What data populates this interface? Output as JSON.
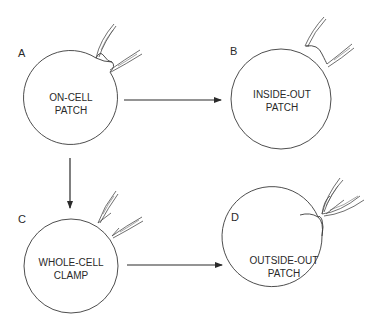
{
  "diagram": {
    "type": "patch-clamp-configurations",
    "stroke_color": "#3a3a3a",
    "background": "#ffffff",
    "panels": [
      {
        "id": "A",
        "letter": "A",
        "line1": "ON-CELL",
        "line2": "PATCH"
      },
      {
        "id": "B",
        "letter": "B",
        "line1": "INSIDE-OUT",
        "line2": "PATCH"
      },
      {
        "id": "C",
        "letter": "C",
        "line1": "WHOLE-CELL",
        "line2": "CLAMP"
      },
      {
        "id": "D",
        "letter": "D",
        "line1": "OUTSIDE-OUT",
        "line2": "PATCH"
      }
    ],
    "arrows": [
      {
        "from": "A",
        "to": "B",
        "direction": "right"
      },
      {
        "from": "A",
        "to": "C",
        "direction": "down"
      },
      {
        "from": "C",
        "to": "D",
        "direction": "right"
      }
    ]
  }
}
